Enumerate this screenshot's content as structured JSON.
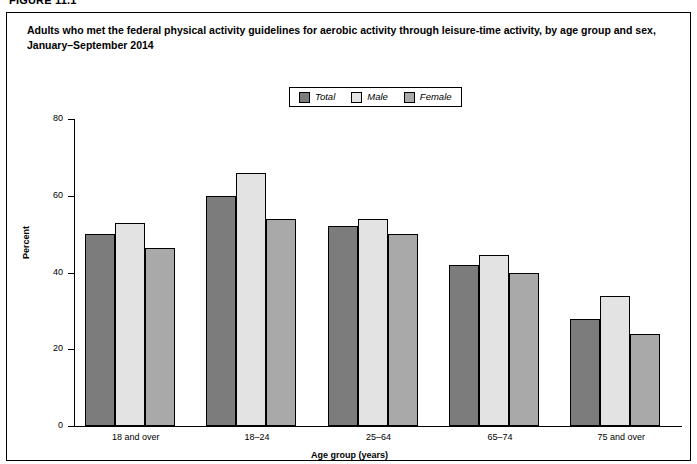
{
  "figure": {
    "number": "FIGURE 11.1"
  },
  "title": {
    "line1": "Adults who met the federal physical activity guidelines for aerobic activity through leisure-time activity, by age group and sex,",
    "line2": "January–September 2014"
  },
  "colors": {
    "total": "#7c7c7c",
    "male": "#e3e3e3",
    "female": "#a9a9a9",
    "axis": "#000000",
    "background": "#ffffff"
  },
  "chart_data": {
    "type": "bar",
    "title": "Adults who met the federal physical activity guidelines for aerobic activity through leisure-time activity, by age group and sex, January–September 2014",
    "xlabel": "Age group (years)",
    "ylabel": "Percent",
    "categories": [
      "18 and over",
      "18–24",
      "25–64",
      "65–74",
      "75 and over"
    ],
    "series": [
      {
        "name": "Total",
        "values": [
          50.0,
          60.0,
          52.0,
          42.0,
          28.0
        ]
      },
      {
        "name": "Male",
        "values": [
          53.0,
          66.0,
          54.0,
          44.5,
          34.0
        ]
      },
      {
        "name": "Female",
        "values": [
          46.5,
          54.0,
          50.0,
          40.0,
          24.0
        ]
      }
    ],
    "ylim": [
      0,
      80
    ],
    "yticks": [
      0,
      20,
      40,
      60,
      80
    ],
    "ytick_labels": [
      "0",
      "20",
      "40",
      "60",
      "80"
    ],
    "grid": false,
    "legend_position": "top-center"
  },
  "legend": {
    "items": [
      {
        "label": "Total",
        "color_key": "total"
      },
      {
        "label": "Male",
        "color_key": "male"
      },
      {
        "label": "Female",
        "color_key": "female"
      }
    ]
  }
}
